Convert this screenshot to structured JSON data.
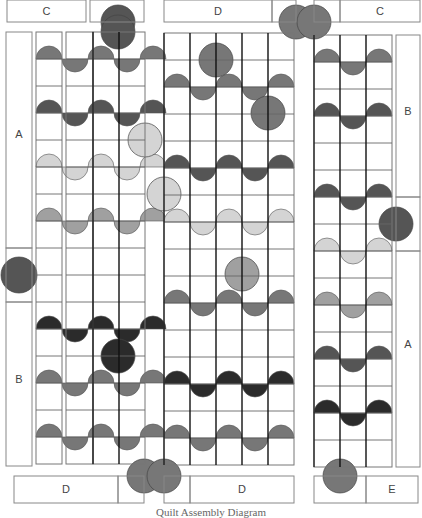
{
  "diagram": {
    "caption": "Quilt Assembly Diagram",
    "colors": {
      "dark": "#2b2b2b",
      "medium_dark": "#555555",
      "medium": "#777777",
      "light": "#a0a0a0",
      "pale": "#d4d4d4",
      "line": "#888888",
      "heavy_line": "#111111"
    },
    "top_border": [
      {
        "label": "C",
        "x": 7,
        "y": 0,
        "w": 79,
        "h": 22
      },
      {
        "label": "",
        "x": 90,
        "y": 0,
        "w": 54,
        "h": 22
      },
      {
        "label": "D",
        "x": 164,
        "y": 0,
        "w": 108,
        "h": 22
      },
      {
        "label": "",
        "x": 272,
        "y": 0,
        "w": 24,
        "h": 22
      },
      {
        "label": "",
        "x": 314,
        "y": 0,
        "w": 26,
        "h": 22
      },
      {
        "label": "C",
        "x": 340,
        "y": 0,
        "w": 80,
        "h": 22
      }
    ],
    "bottom_border": [
      {
        "label": "D",
        "x": 14,
        "y": 476,
        "w": 104,
        "h": 27
      },
      {
        "label": "",
        "x": 118,
        "y": 476,
        "w": 26,
        "h": 27
      },
      {
        "label": "",
        "x": 164,
        "y": 476,
        "w": 26,
        "h": 27
      },
      {
        "label": "D",
        "x": 190,
        "y": 476,
        "w": 104,
        "h": 27
      },
      {
        "label": "",
        "x": 314,
        "y": 476,
        "w": 52,
        "h": 27
      },
      {
        "label": "E",
        "x": 366,
        "y": 476,
        "w": 52,
        "h": 27
      }
    ],
    "side_strips": [
      {
        "label": "A",
        "x": 6,
        "y": 32,
        "w": 26,
        "h": 216,
        "label_y": 135
      },
      {
        "label": "",
        "x": 6,
        "y": 248,
        "w": 26,
        "h": 54,
        "label_y": 0
      },
      {
        "label": "B",
        "x": 6,
        "y": 302,
        "w": 26,
        "h": 164,
        "label_y": 380
      },
      {
        "label": "B",
        "x": 396,
        "y": 35,
        "w": 24,
        "h": 162,
        "label_y": 112
      },
      {
        "label": "",
        "x": 396,
        "y": 197,
        "w": 24,
        "h": 54,
        "label_y": 0
      },
      {
        "label": "A",
        "x": 396,
        "y": 251,
        "w": 24,
        "h": 216,
        "label_y": 345
      }
    ],
    "grid_panels": [
      {
        "name": "left-col-1",
        "x": 36,
        "y": 32,
        "cols": 1,
        "rows": 16,
        "cw": 26,
        "ch": 27,
        "heavy": false
      },
      {
        "name": "left-col-2",
        "x": 66,
        "y": 32,
        "cols": 1,
        "rows": 16,
        "cw": 27,
        "ch": 27,
        "heavy": false
      },
      {
        "name": "left-col-34",
        "x": 93,
        "y": 32,
        "cols": 2,
        "rows": 16,
        "cw": 26,
        "ch": 27,
        "heavy": true
      },
      {
        "name": "middle",
        "x": 164,
        "y": 33,
        "cols": 5,
        "rows": 16,
        "cw": 26,
        "ch": 27,
        "heavy": true
      },
      {
        "name": "right",
        "x": 314,
        "y": 35,
        "cols": 3,
        "rows": 16,
        "cw": 26,
        "ch": 27,
        "heavy": true
      }
    ],
    "circles": [
      {
        "cx": 118,
        "cy": 22,
        "r": 17,
        "tone": "medium_dark",
        "clip": "bottom-border-top"
      },
      {
        "cx": 118,
        "cy": 32,
        "r": 17,
        "tone": "medium_dark"
      },
      {
        "cx": 19,
        "cy": 275,
        "r": 18,
        "tone": "medium_dark"
      },
      {
        "cx": 118,
        "cy": 356,
        "r": 17,
        "tone": "dark"
      },
      {
        "cx": 216,
        "cy": 60,
        "r": 17,
        "tone": "medium"
      },
      {
        "cx": 268,
        "cy": 113,
        "r": 17,
        "tone": "medium"
      },
      {
        "cx": 164,
        "cy": 194,
        "r": 17,
        "tone": "pale"
      },
      {
        "cx": 242,
        "cy": 274,
        "r": 17,
        "tone": "light"
      },
      {
        "cx": 164,
        "cy": 113,
        "r": 0,
        "tone": "medium"
      },
      {
        "cx": 396,
        "cy": 224,
        "r": 17,
        "tone": "medium_dark"
      },
      {
        "cx": 340,
        "cy": 476,
        "r": 17,
        "tone": "medium"
      },
      {
        "cx": 145,
        "cy": 140,
        "r": 17,
        "tone": "pale"
      },
      {
        "cx": 92,
        "cy": 140,
        "r": 0,
        "tone": "pale"
      },
      {
        "cx": 164,
        "cy": 32,
        "r": 0,
        "tone": "medium"
      },
      {
        "cx": 296,
        "cy": 22,
        "r": 17,
        "tone": "medium"
      },
      {
        "cx": 314,
        "cy": 22,
        "r": 17,
        "tone": "medium"
      },
      {
        "cx": 144,
        "cy": 476,
        "r": 17,
        "tone": "medium"
      },
      {
        "cx": 164,
        "cy": 476,
        "r": 17,
        "tone": "medium"
      }
    ],
    "waves": [
      {
        "row_y": 59,
        "tone": "medium",
        "panel": "left"
      },
      {
        "row_y": 113,
        "tone": "medium_dark",
        "panel": "left"
      },
      {
        "row_y": 167,
        "tone": "pale",
        "panel": "left"
      },
      {
        "row_y": 221,
        "tone": "light",
        "panel": "left"
      },
      {
        "row_y": 329,
        "tone": "dark",
        "panel": "left"
      },
      {
        "row_y": 383,
        "tone": "medium",
        "panel": "left"
      },
      {
        "row_y": 437,
        "tone": "medium",
        "panel": "left"
      },
      {
        "row_y": 87,
        "tone": "medium",
        "panel": "middle"
      },
      {
        "row_y": 168,
        "tone": "medium_dark",
        "panel": "middle"
      },
      {
        "row_y": 222,
        "tone": "pale",
        "panel": "middle"
      },
      {
        "row_y": 303,
        "tone": "medium",
        "panel": "middle"
      },
      {
        "row_y": 384,
        "tone": "dark",
        "panel": "middle"
      },
      {
        "row_y": 438,
        "tone": "medium",
        "panel": "middle"
      },
      {
        "row_y": 62,
        "tone": "medium",
        "panel": "right"
      },
      {
        "row_y": 116,
        "tone": "medium_dark",
        "panel": "right"
      },
      {
        "row_y": 197,
        "tone": "medium_dark",
        "panel": "right"
      },
      {
        "row_y": 251,
        "tone": "pale",
        "panel": "right"
      },
      {
        "row_y": 305,
        "tone": "light",
        "panel": "right"
      },
      {
        "row_y": 359,
        "tone": "medium_dark",
        "panel": "right"
      },
      {
        "row_y": 413,
        "tone": "dark",
        "panel": "right"
      }
    ]
  }
}
